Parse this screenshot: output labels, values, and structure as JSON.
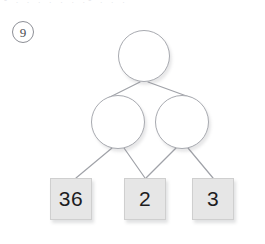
{
  "page": {
    "width": 265,
    "height": 244,
    "background": "#ffffff",
    "top_cut_text": "- : : : : : : :- : : :"
  },
  "problem": {
    "number_label": "9",
    "number_icon": "circled-number"
  },
  "diagram": {
    "type": "factor-tree",
    "colors": {
      "node_stroke": "#a8aab0",
      "node_fill": "#ffffff",
      "edge_stroke": "#a0a2a8",
      "leaf_fill": "#e6e6e6",
      "leaf_border": "#cfcfcf",
      "leaf_text": "#1d1d1f"
    },
    "nodes": [
      {
        "id": "root",
        "shape": "circle",
        "value": "",
        "cx": 144,
        "cy": 56,
        "r": 26
      },
      {
        "id": "branch-left",
        "shape": "circle",
        "value": "",
        "cx": 118,
        "cy": 122,
        "r": 27
      },
      {
        "id": "branch-right",
        "shape": "circle",
        "value": "",
        "cx": 182,
        "cy": 122,
        "r": 27
      },
      {
        "id": "leaf-1",
        "shape": "box",
        "value": "36",
        "x": 50,
        "y": 178,
        "w": 42,
        "h": 42
      },
      {
        "id": "leaf-2",
        "shape": "box",
        "value": "2",
        "x": 124,
        "y": 178,
        "w": 42,
        "h": 42
      },
      {
        "id": "leaf-3",
        "shape": "box",
        "value": "3",
        "x": 192,
        "y": 178,
        "w": 42,
        "h": 42
      }
    ],
    "edges": [
      {
        "from": "root",
        "to": "branch-left",
        "x1": 140,
        "y1": 82,
        "x2": 108,
        "y2": 98
      },
      {
        "from": "root",
        "to": "branch-right",
        "x1": 148,
        "y1": 82,
        "x2": 192,
        "y2": 98
      },
      {
        "from": "branch-left",
        "to": "leaf-1",
        "x1": 112,
        "y1": 148,
        "x2": 76,
        "y2": 178
      },
      {
        "from": "branch-left",
        "to": "leaf-2",
        "x1": 124,
        "y1": 148,
        "x2": 145,
        "y2": 178
      },
      {
        "from": "branch-right",
        "to": "leaf-2",
        "x1": 176,
        "y1": 148,
        "x2": 146,
        "y2": 178
      },
      {
        "from": "branch-right",
        "to": "leaf-3",
        "x1": 188,
        "y1": 148,
        "x2": 213,
        "y2": 178
      }
    ]
  }
}
